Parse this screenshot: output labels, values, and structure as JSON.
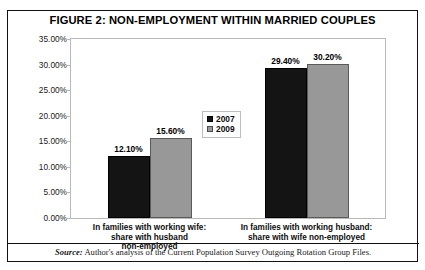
{
  "figure": {
    "title": "FIGURE 2: NON-EMPLOYMENT WITHIN MARRIED COUPLES",
    "source_keyword": "Source:",
    "source_text": " Author's analysis of the Current Population Survey Outgoing Rotation Group Files."
  },
  "colors": {
    "series_2007": "#141414",
    "series_2009": "#989898",
    "frame": "#111111",
    "plot_border": "#b9b9b9",
    "text": "#0d0d0d"
  },
  "chart_data": {
    "type": "bar",
    "title": "FIGURE 2: NON-EMPLOYMENT WITHIN MARRIED COUPLES",
    "xlabel": "",
    "ylabel": "",
    "categories": [
      "In families with working wife: share with husband non-employed",
      "In families with working husband: share with wife non-employed"
    ],
    "category_lines": [
      [
        "In families with working wife:",
        "share with husband",
        "non-employed"
      ],
      [
        "In families with working husband:",
        "share with wife non-employed"
      ]
    ],
    "series": [
      {
        "name": "2007",
        "values": [
          12.1,
          29.4
        ],
        "labels": [
          "12.10%",
          "29.40%"
        ]
      },
      {
        "name": "2009",
        "values": [
          15.6,
          30.2
        ],
        "labels": [
          "15.60%",
          "30.20%"
        ]
      }
    ],
    "series_note": "2007 values are the first bar of each group; 2009 values are the second bar of each group",
    "ylim": [
      0,
      35
    ],
    "ytick_values": [
      0,
      5,
      10,
      15,
      20,
      25,
      30,
      35
    ],
    "ytick_labels": [
      "0.00%",
      "5.00%",
      "10.00%",
      "15.00%",
      "20.00%",
      "25.00%",
      "30.00%",
      "35.00%"
    ],
    "grid": false,
    "legend_position": "center",
    "legend_entries": [
      "2007",
      "2009"
    ]
  }
}
